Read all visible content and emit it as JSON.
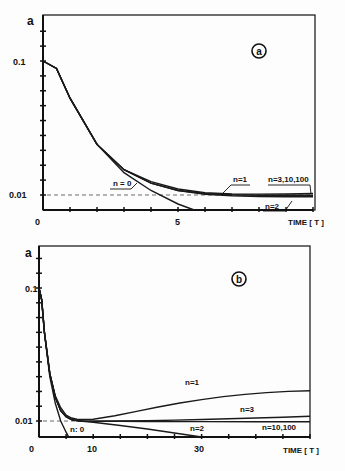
{
  "chart_data": [
    {
      "panel": "a",
      "type": "line",
      "badge": "a",
      "ylabel": "a",
      "xlabel": "TIME [ T ]",
      "x_ticks": [
        {
          "value": 0,
          "label": "0"
        },
        {
          "value": 5,
          "label": "5"
        }
      ],
      "y_ticks": [
        {
          "value": 0.1,
          "label": "0.1"
        },
        {
          "value": 0.01,
          "label": "0.01"
        }
      ],
      "xlim": [
        0,
        10
      ],
      "ylim": [
        0,
        0.135
      ],
      "reference_line": {
        "y": 0.01,
        "style": "dashed"
      },
      "series": [
        {
          "name": "n = 0",
          "x": [
            0,
            0.5,
            1,
            2,
            3,
            4,
            5,
            5.6
          ],
          "y": [
            0.1,
            0.095,
            0.075,
            0.044,
            0.025,
            0.013,
            0.004,
            0.0
          ]
        },
        {
          "name": "n=1",
          "x": [
            0,
            0.5,
            1,
            2,
            3,
            4,
            5,
            6,
            7,
            8,
            9,
            10
          ],
          "y": [
            0.1,
            0.095,
            0.075,
            0.044,
            0.027,
            0.019,
            0.014,
            0.0115,
            0.0107,
            0.0106,
            0.0107,
            0.011
          ]
        },
        {
          "name": "n=2",
          "x": [
            0,
            0.5,
            1,
            2,
            3,
            4,
            5,
            6,
            7,
            8,
            9,
            10
          ],
          "y": [
            0.1,
            0.095,
            0.075,
            0.044,
            0.027,
            0.018,
            0.013,
            0.0105,
            0.0095,
            0.009,
            0.0088,
            0.0088
          ]
        },
        {
          "name": "n=3,10,100",
          "x": [
            0,
            0.5,
            1,
            2,
            3,
            4,
            5,
            6,
            7,
            8,
            9,
            10
          ],
          "y": [
            0.1,
            0.095,
            0.075,
            0.044,
            0.027,
            0.018,
            0.013,
            0.011,
            0.0102,
            0.0099,
            0.0098,
            0.0098
          ]
        }
      ]
    },
    {
      "panel": "b",
      "type": "line",
      "badge": "b",
      "ylabel": "a",
      "xlabel": "TIME [ T ]",
      "x_ticks": [
        {
          "value": 0,
          "label": "0"
        },
        {
          "value": 10,
          "label": "10"
        },
        {
          "value": 30,
          "label": "30"
        }
      ],
      "y_ticks": [
        {
          "value": 0.1,
          "label": "0.1"
        },
        {
          "value": 0.01,
          "label": "0.01"
        }
      ],
      "xlim": [
        0,
        50
      ],
      "ylim": [
        0,
        0.125
      ],
      "reference_line": {
        "y": 0.01,
        "style": "dashed"
      },
      "series": [
        {
          "name": "n=0",
          "x": [
            0,
            0.5,
            1,
            2,
            3,
            4,
            5,
            5.5
          ],
          "y": [
            0.1,
            0.092,
            0.07,
            0.04,
            0.022,
            0.01,
            0.003,
            0.0
          ]
        },
        {
          "name": "n=1",
          "x": [
            0,
            0.5,
            1,
            2,
            3,
            4,
            5,
            6,
            7,
            8,
            10,
            14,
            18,
            22,
            26,
            30,
            34,
            38,
            42,
            46,
            50
          ],
          "y": [
            0.1,
            0.092,
            0.07,
            0.042,
            0.027,
            0.019,
            0.014,
            0.012,
            0.0112,
            0.011,
            0.0112,
            0.0135,
            0.0165,
            0.0195,
            0.0222,
            0.0245,
            0.0265,
            0.028,
            0.0292,
            0.03,
            0.0305
          ]
        },
        {
          "name": "n=2",
          "x": [
            0,
            0.5,
            1,
            2,
            3,
            4,
            5,
            6,
            7,
            8,
            10,
            15,
            20,
            25,
            30
          ],
          "y": [
            0.1,
            0.092,
            0.07,
            0.042,
            0.026,
            0.017,
            0.013,
            0.011,
            0.0102,
            0.0098,
            0.0092,
            0.0072,
            0.005,
            0.0025,
            0.0
          ]
        },
        {
          "name": "n=3",
          "x": [
            0,
            0.5,
            1,
            2,
            3,
            4,
            5,
            6,
            7,
            8,
            10,
            15,
            20,
            25,
            30,
            35,
            40,
            45,
            50
          ],
          "y": [
            0.1,
            0.092,
            0.07,
            0.042,
            0.026,
            0.017,
            0.013,
            0.011,
            0.0103,
            0.01,
            0.0099,
            0.01,
            0.0102,
            0.0106,
            0.011,
            0.0115,
            0.012,
            0.0126,
            0.0132
          ]
        },
        {
          "name": "n=10,100",
          "x": [
            0,
            0.5,
            1,
            2,
            3,
            4,
            5,
            6,
            7,
            8,
            10,
            15,
            20,
            30,
            40,
            50
          ],
          "y": [
            0.1,
            0.092,
            0.07,
            0.042,
            0.026,
            0.017,
            0.013,
            0.011,
            0.0103,
            0.01,
            0.0099,
            0.0098,
            0.0097,
            0.0096,
            0.0095,
            0.0095
          ]
        }
      ]
    }
  ],
  "panels": {
    "a": {
      "badge": "a",
      "ylabel": "a",
      "xlabel": "TIME [ T ]",
      "tick_0": "0",
      "tick_5": "5",
      "ytick_01": "0.1",
      "ytick_001": "0.01",
      "labels": {
        "n0": "n = 0",
        "n1": "n=1",
        "n2": "n=2",
        "n3": "n=3,10,100"
      }
    },
    "b": {
      "badge": "b",
      "ylabel": "a",
      "xlabel": "TIME [ T ]",
      "tick_0": "0",
      "tick_10": "10",
      "tick_30": "30",
      "ytick_01": "0.1",
      "ytick_001": "0.01",
      "labels": {
        "n0": "n: 0",
        "n1": "n=1",
        "n2": "n=2",
        "n3": "n=3",
        "n10": "n=10,100"
      }
    }
  }
}
